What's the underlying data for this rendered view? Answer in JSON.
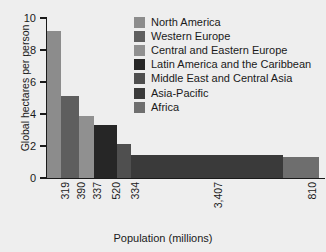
{
  "chart_data": {
    "type": "bar",
    "title": "",
    "subtitle": "",
    "xlabel": "Population (millions)",
    "ylabel": "Global hectares per person",
    "variable_width": true,
    "note": "Marimekko-style chart: bar width is proportional to population, bar height is ecological footprint in global hectares per person.",
    "categories": [
      "North America",
      "Western Europe",
      "Central and Eastern Europe",
      "Latin America and the Caribbean",
      "Middle East and Central Asia",
      "Asia-Pacific",
      "Africa"
    ],
    "values": [
      9.2,
      5.1,
      3.85,
      3.3,
      2.15,
      1.45,
      1.3
    ],
    "widths": [
      319,
      390,
      337,
      520,
      334,
      3407,
      810
    ],
    "xtick_labels": [
      "319",
      "390",
      "337",
      "520",
      "334",
      "3,407",
      "810"
    ],
    "ytick_labels": [
      "0",
      "2",
      "4",
      "6",
      "8",
      "10"
    ],
    "ytick_values": [
      0,
      2,
      4,
      6,
      8,
      10
    ],
    "ylim": [
      0,
      10
    ],
    "xlim": [
      0,
      6117
    ],
    "grid": false,
    "legend_position": "top-right",
    "colors": [
      "#8c8c8c",
      "#5e5e5e",
      "#909090",
      "#262626",
      "#4f4f4f",
      "#3a3a3a",
      "#6e6e6e"
    ],
    "series": [
      {
        "name": "Ecological footprint",
        "points": [
          {
            "region": "North America",
            "population_millions": 319,
            "population_label": "319",
            "gha_per_person": 9.2,
            "color": "#8c8c8c"
          },
          {
            "region": "Western Europe",
            "population_millions": 390,
            "population_label": "390",
            "gha_per_person": 5.1,
            "color": "#5e5e5e"
          },
          {
            "region": "Central and Eastern Europe",
            "population_millions": 337,
            "population_label": "337",
            "gha_per_person": 3.85,
            "color": "#909090"
          },
          {
            "region": "Latin America and the Caribbean",
            "population_millions": 520,
            "population_label": "520",
            "gha_per_person": 3.3,
            "color": "#262626"
          },
          {
            "region": "Middle East and Central Asia",
            "population_millions": 334,
            "population_label": "334",
            "gha_per_person": 2.15,
            "color": "#4f4f4f"
          },
          {
            "region": "Asia-Pacific",
            "population_millions": 3407,
            "population_label": "3,407",
            "gha_per_person": 1.45,
            "color": "#3a3a3a"
          },
          {
            "region": "Africa",
            "population_millions": 810,
            "population_label": "810",
            "gha_per_person": 1.3,
            "color": "#6e6e6e"
          }
        ]
      }
    ],
    "legend": [
      {
        "label": "North America",
        "color": "#8c8c8c"
      },
      {
        "label": "Western Europe",
        "color": "#5e5e5e"
      },
      {
        "label": "Central and Eastern Europe",
        "color": "#909090"
      },
      {
        "label": "Latin America and the Caribbean",
        "color": "#262626"
      },
      {
        "label": "Middle East and Central Asia",
        "color": "#4f4f4f"
      },
      {
        "label": "Asia-Pacific",
        "color": "#3a3a3a"
      },
      {
        "label": "Africa",
        "color": "#6e6e6e"
      }
    ]
  },
  "figure": {
    "background_color": "#eeeeee",
    "axis_color": "#1a1a1a",
    "text_color": "#1a1a1a"
  }
}
